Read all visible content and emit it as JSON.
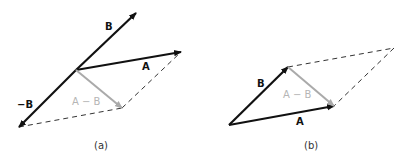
{
  "colors": {
    "vector": "#111111",
    "difference": "#aaaaaa",
    "difference_label": "#b5b5b5",
    "dashed": "#333333",
    "caption": "#333333"
  },
  "panel_a": {
    "caption": "(a)",
    "labels": {
      "B": "B",
      "A": "A",
      "neg_B": "−B",
      "A_minus_B": "A − B"
    },
    "vectors": [
      {
        "name": "B",
        "from": [
          76,
          70
        ],
        "to": [
          136,
          13
        ],
        "style": "solid-black"
      },
      {
        "name": "A",
        "from": [
          76,
          70
        ],
        "to": [
          181,
          52
        ],
        "style": "solid-black"
      },
      {
        "name": "-B",
        "from": [
          76,
          70
        ],
        "to": [
          19,
          127
        ],
        "style": "solid-black"
      },
      {
        "name": "A-B",
        "from": [
          76,
          70
        ],
        "to": [
          122,
          108
        ],
        "style": "solid-gray"
      }
    ],
    "dashed_lines": [
      {
        "from": [
          19,
          127
        ],
        "to": [
          122,
          108
        ]
      },
      {
        "from": [
          122,
          108
        ],
        "to": [
          181,
          52
        ]
      }
    ]
  },
  "panel_b": {
    "caption": "(b)",
    "labels": {
      "B": "B",
      "A": "A",
      "A_minus_B": "A − B"
    },
    "vectors": [
      {
        "name": "B",
        "from": [
          229,
          125
        ],
        "to": [
          288,
          67
        ],
        "style": "solid-black"
      },
      {
        "name": "A",
        "from": [
          229,
          125
        ],
        "to": [
          334,
          106
        ],
        "style": "solid-black"
      },
      {
        "name": "A-B",
        "from": [
          288,
          67
        ],
        "to": [
          334,
          106
        ],
        "style": "solid-gray"
      }
    ],
    "dashed_lines": [
      {
        "from": [
          288,
          67
        ],
        "to": [
          394,
          48
        ]
      },
      {
        "from": [
          394,
          48
        ],
        "to": [
          334,
          106
        ]
      }
    ]
  }
}
